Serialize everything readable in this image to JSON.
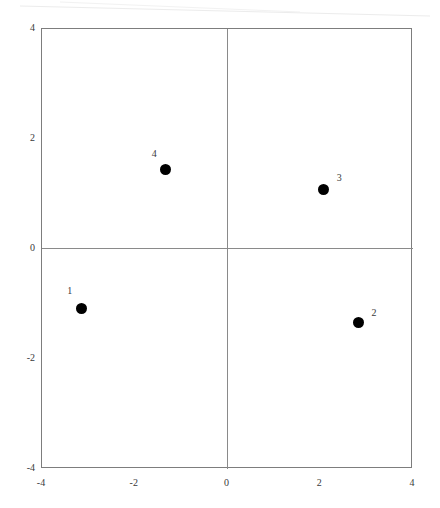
{
  "figure": {
    "background_color": "#ffffff",
    "frame_color": "#7d7d7d",
    "axis_color": "#8a8a8a",
    "marker_color": "#000000",
    "label_color": "#3a3a3a"
  },
  "chart_data": {
    "type": "scatter",
    "title": "",
    "subtitle": "",
    "xlabel": "",
    "ylabel": "",
    "xlim": [
      -4,
      4
    ],
    "ylim": [
      -4,
      4
    ],
    "xticks": [
      "-4",
      "-2",
      "0",
      "2",
      "4"
    ],
    "yticks": [
      "4",
      "2",
      "0",
      "-2",
      "-4"
    ],
    "xtick_values": [
      -4,
      -2,
      0,
      2,
      4
    ],
    "ytick_values": [
      4,
      2,
      0,
      -2,
      -4
    ],
    "grid": false,
    "legend": null,
    "axes_style": "box-frame-with-zero-crosshair",
    "marker": "filled-circle",
    "marker_size": 11,
    "points": [
      {
        "label": "1",
        "x": -3.15,
        "y": -1.09,
        "label_dx": -0.25,
        "label_dy": 0.33
      },
      {
        "label": "2",
        "x": 2.83,
        "y": -1.33,
        "label_dx": 0.33,
        "label_dy": 0.17
      },
      {
        "label": "3",
        "x": 2.08,
        "y": 1.09,
        "label_dx": 0.33,
        "label_dy": 0.21
      },
      {
        "label": "4",
        "x": -1.33,
        "y": 1.45,
        "label_dx": -0.25,
        "label_dy": 0.28
      }
    ]
  }
}
